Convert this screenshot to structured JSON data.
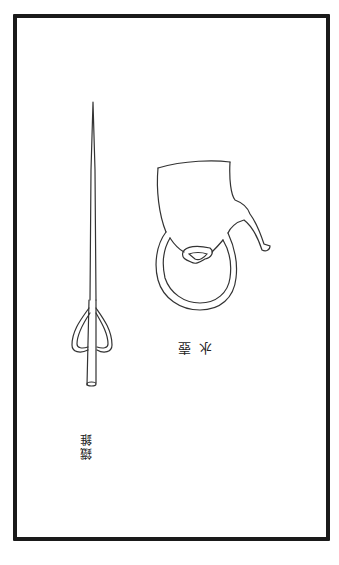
{
  "page": {
    "illustrations": [
      {
        "id": "water-pot",
        "caption": "水壺"
      },
      {
        "id": "iron-awl",
        "caption": "鐵錐"
      }
    ],
    "colors": {
      "ink": "#1a1a1a",
      "paper": "#ffffff"
    }
  }
}
